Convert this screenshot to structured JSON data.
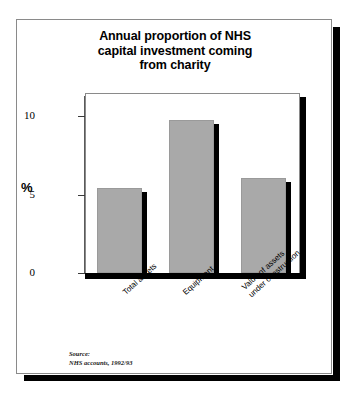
{
  "figure": {
    "title": "Annual proportion of NHS\ncapital investment coming\nfrom charity",
    "source": "Source:\nNHS accounts, 1992/93",
    "y_axis_title": "%"
  },
  "chart_data": {
    "type": "bar",
    "title": "Annual proportion of NHS capital investment coming from charity",
    "xlabel": "",
    "ylabel": "%",
    "ylim": [
      0,
      11.5
    ],
    "yticks": [
      0,
      5,
      10
    ],
    "ytick_labels": [
      "0",
      "5",
      "10"
    ],
    "grid": false,
    "legend": false,
    "categories": [
      "Total assets",
      "Equipment",
      "Value of assets\nunder construction"
    ],
    "values": [
      5.4,
      9.8,
      6.1
    ],
    "series": [
      {
        "name": "Proportion from charity",
        "values": [
          5.4,
          9.8,
          6.1
        ]
      }
    ],
    "bar_color": "#a9a9a9",
    "bar_edge_shadow_color": "#000000",
    "annotations": [
      "Source:",
      "NHS accounts, 1992/93"
    ]
  }
}
